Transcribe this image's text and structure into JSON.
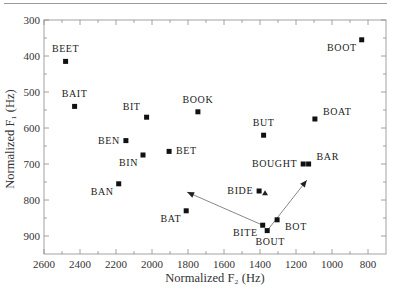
{
  "chart_data": {
    "type": "scatter",
    "title": "",
    "xlabel": "Normalized F₂ (Hz)",
    "ylabel": "Normalized F₁ (Hz)",
    "xlim": [
      2600,
      700
    ],
    "ylim": [
      300,
      950
    ],
    "x_reversed": true,
    "y_reversed": true,
    "xticks": [
      2600,
      2400,
      2200,
      2000,
      1800,
      1600,
      1400,
      1200,
      1000,
      800
    ],
    "yticks": [
      300,
      400,
      500,
      600,
      700,
      800,
      900
    ],
    "grid": false,
    "legend": "none",
    "points": [
      {
        "label": "BEET",
        "x": 2480,
        "y": 415,
        "label_pos": "above"
      },
      {
        "label": "BAIT",
        "x": 2430,
        "y": 540,
        "label_pos": "above"
      },
      {
        "label": "BIT",
        "x": 2030,
        "y": 570,
        "label_pos": "above-left"
      },
      {
        "label": "BOOK",
        "x": 1745,
        "y": 555,
        "label_pos": "above"
      },
      {
        "label": "BEN",
        "x": 2145,
        "y": 635,
        "label_pos": "left"
      },
      {
        "label": "BIN",
        "x": 2050,
        "y": 675,
        "label_pos": "below-left"
      },
      {
        "label": "BET",
        "x": 1905,
        "y": 665,
        "label_pos": "right"
      },
      {
        "label": "BAN",
        "x": 2185,
        "y": 755,
        "label_pos": "below-left"
      },
      {
        "label": "BAT",
        "x": 1810,
        "y": 830,
        "label_pos": "below-left"
      },
      {
        "label": "BIDE",
        "x": 1405,
        "y": 775,
        "label_pos": "left"
      },
      {
        "label": "BITE",
        "x": 1385,
        "y": 870,
        "label_pos": "below-left"
      },
      {
        "label": "BOUT",
        "x": 1360,
        "y": 885,
        "label_pos": "below"
      },
      {
        "label": "BOT",
        "x": 1305,
        "y": 855,
        "label_pos": "below-right"
      },
      {
        "label": "BOUGHT",
        "x": 1160,
        "y": 700,
        "label_pos": "left"
      },
      {
        "label": "BAR",
        "x": 1130,
        "y": 700,
        "label_pos": "above-right"
      },
      {
        "label": "BUT",
        "x": 1380,
        "y": 620,
        "label_pos": "above"
      },
      {
        "label": "BOAT",
        "x": 1095,
        "y": 575,
        "label_pos": "above-right"
      },
      {
        "label": "BOOT",
        "x": 835,
        "y": 355,
        "label_pos": "below-left"
      }
    ],
    "arrows": [
      {
        "from": "BITE",
        "to": [
          1805,
          778
        ]
      },
      {
        "from": "BOUT",
        "to": [
          1140,
          745
        ]
      }
    ],
    "triangle_markers": [
      {
        "x": 1372,
        "y": 781
      }
    ]
  }
}
